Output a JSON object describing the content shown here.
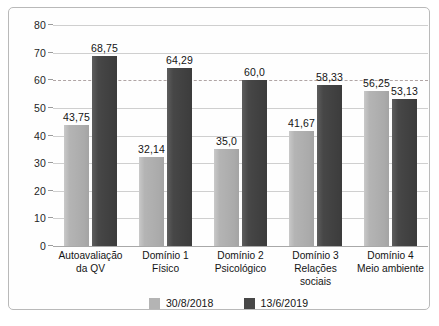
{
  "chart_data": {
    "type": "bar",
    "title": "",
    "subtitle": "",
    "xlabel": "",
    "ylabel": "",
    "ylim": [
      0,
      80
    ],
    "yticks": [
      0,
      10,
      20,
      30,
      40,
      50,
      60,
      70,
      80
    ],
    "ytick_labels": [
      "0",
      "10",
      "20",
      "30",
      "40",
      "50",
      "60",
      "70",
      "80"
    ],
    "grid": true,
    "grid_axis": "y",
    "highlight_gridline": 60,
    "legend_position": "bottom-center",
    "decimal_separator": ",",
    "categories": [
      "Autoavaliação da QV",
      "Domínio 1 Físico",
      "Domínio 2 Psicológico",
      "Domínio 3 Relações sociais",
      "Domínio 4 Meio ambiente"
    ],
    "category_lines": [
      {
        "line1": "Autoavaliação",
        "line2": "da QV"
      },
      {
        "line1": "Domínio 1",
        "line2": "Físico"
      },
      {
        "line1": "Domínio 2",
        "line2": "Psicológico"
      },
      {
        "line1": "Domínio 3",
        "line2": "Relações sociais"
      },
      {
        "line1": "Domínio 4",
        "line2": "Meio ambiente"
      }
    ],
    "series": [
      {
        "name": "30/8/2018",
        "color": "#b4b4b4",
        "values": [
          43.75,
          32.14,
          35.0,
          41.67,
          56.25
        ],
        "labels": [
          "43,75",
          "32,14",
          "35,0",
          "41,67",
          "56,25"
        ]
      },
      {
        "name": "13/6/2019",
        "color": "#474747",
        "values": [
          68.75,
          64.29,
          60.0,
          58.33,
          53.13
        ],
        "labels": [
          "68,75",
          "64,29",
          "60,0",
          "58,33",
          "53,13"
        ]
      }
    ]
  },
  "legend": {
    "items": [
      {
        "label": "30/8/2018",
        "color": "#b4b4b4"
      },
      {
        "label": "13/6/2019",
        "color": "#474747"
      }
    ]
  },
  "colors": {
    "series_1": "#b4b4b4",
    "series_2": "#474747",
    "gridline": "#cfcfcf",
    "highlight_gridline": "#b0a5a5",
    "frame_border": "#b9b9b9",
    "text": "#141414",
    "background": "#ffffff"
  }
}
